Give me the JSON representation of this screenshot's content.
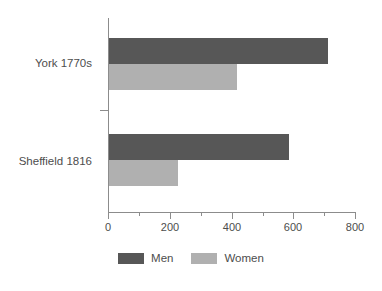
{
  "chart_data": {
    "type": "bar",
    "orientation": "horizontal",
    "title": "",
    "subtitle": "",
    "xlabel": "",
    "ylabel": "",
    "categories": [
      "York 1770s",
      "Sheffield 1816"
    ],
    "series": [
      {
        "name": "Men",
        "color": "#575757",
        "values": [
          710,
          583
        ]
      },
      {
        "name": "Women",
        "color": "#b0b0b0",
        "values": [
          415,
          222
        ]
      }
    ],
    "xlim": [
      0,
      800
    ],
    "xticks": [
      0,
      200,
      400,
      600,
      800
    ],
    "xtick_labels": [
      "0",
      "200",
      "400",
      "600",
      "800"
    ],
    "xticks_minor": [
      100,
      300,
      500,
      700
    ],
    "grid": false,
    "legend_position": "bottom-center",
    "legend_entries": [
      "Men",
      "Women"
    ],
    "axis_color": "#8c8c8c",
    "text_color": "#4d4d4d",
    "background": "#ffffff"
  },
  "axis": {
    "tick_0": "0",
    "tick_200": "200",
    "tick_400": "400",
    "tick_600": "600",
    "tick_800": "800"
  },
  "categories": {
    "york": "York 1770s",
    "sheffield": "Sheffield 1816"
  },
  "legend": {
    "men": "Men",
    "women": "Women"
  }
}
